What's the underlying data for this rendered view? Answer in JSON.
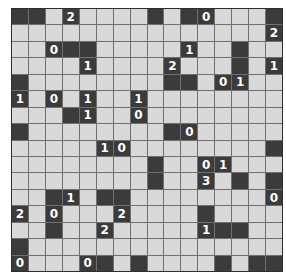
{
  "puzzle": {
    "name": "light-up-grid",
    "cols": 16,
    "rows": 16,
    "legend": {
      "#": "black-wall",
      ".": "empty-white-cell",
      "0-4": "numbered-wall"
    },
    "colors": {
      "wall": "#3b3b3b",
      "empty": "#d9d9d9",
      "grid_line": "#6f6f6f",
      "number": "#ffffff"
    },
    "grid": [
      "##.2....#.#0...#",
      "...............2",
      "..0##.....1..#..",
      "....1....2...#.1",
      "#........##.01..",
      "1.0.1..1........",
      "...#1..0........",
      "#........#0.....",
      ".....10........#",
      "........#..01...",
      "........#..3.#.#",
      "..#1.##........0",
      "2.0...2....#....",
      "..#..2.....1##..",
      "#...............",
      "0...0#.#....#.##"
    ]
  }
}
